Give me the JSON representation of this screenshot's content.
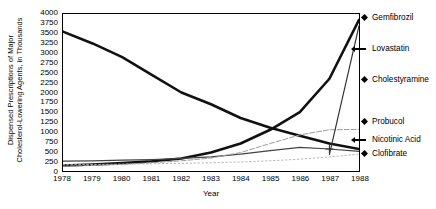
{
  "chart_data": {
    "type": "line",
    "title": "",
    "xlabel": "Year",
    "ylabel": "Dispensed Prescriptions of Major Cholesterol-Lowering Agents, in Thousands",
    "ylabel_line1": "Dispensed Prescriptions of Major",
    "ylabel_line2": "Cholesterol-Lowering Agents, in Thousands",
    "x": [
      1978,
      1979,
      1980,
      1981,
      1982,
      1983,
      1984,
      1985,
      1986,
      1987,
      1988
    ],
    "xtick_labels": [
      "1978",
      "1979",
      "1980",
      "1981",
      "1982",
      "1983",
      "1984",
      "1985",
      "1986",
      "1987",
      "1988"
    ],
    "xlim": [
      1978,
      1988
    ],
    "ylim": [
      0,
      4000
    ],
    "ytick_labels": [
      "4000",
      "3750",
      "3500",
      "3250",
      "3000",
      "2750",
      "2500",
      "2250",
      "2000",
      "1750",
      "1500",
      "1250",
      "1000",
      "750",
      "500",
      "250",
      "0"
    ],
    "ytick_values": [
      4000,
      3750,
      3500,
      3250,
      3000,
      2750,
      2500,
      2250,
      2000,
      1750,
      1500,
      1250,
      1000,
      750,
      500,
      250,
      0
    ],
    "grid": false,
    "legend_position": "right-outside",
    "series": [
      {
        "name": "Clofibrate",
        "marker": "diamond",
        "style": "solid-thick",
        "color": "#111111",
        "values": [
          3550,
          3250,
          2900,
          2450,
          2000,
          1700,
          1350,
          1100,
          900,
          700,
          560
        ]
      },
      {
        "name": "Gemfibrozil",
        "marker": "diamond",
        "style": "solid-thick",
        "color": "#111111",
        "values": [
          140,
          165,
          200,
          250,
          320,
          470,
          700,
          1050,
          1500,
          2350,
          3850
        ]
      },
      {
        "name": "Cholestyramine",
        "marker": "diamond",
        "style": "solid-thin",
        "color": "#444444",
        "values": [
          250,
          260,
          275,
          290,
          320,
          360,
          430,
          520,
          600,
          560,
          500
        ]
      },
      {
        "name": "Probucol",
        "marker": "diamond",
        "style": "dashed-light",
        "color": "#9a9a9a",
        "values": [
          120,
          140,
          170,
          210,
          260,
          330,
          470,
          700,
          920,
          1050,
          1060
        ]
      },
      {
        "name": "Nicotinic Acid",
        "marker": "arrow",
        "style": "dotted",
        "color": "#b5b5b5",
        "values": [
          160,
          165,
          175,
          185,
          195,
          210,
          230,
          260,
          300,
          360,
          430
        ]
      },
      {
        "name": "Lovastatin",
        "marker": "arrow",
        "style": "solid-thin",
        "color": "#333333",
        "values": [
          null,
          null,
          null,
          null,
          null,
          null,
          null,
          null,
          null,
          420,
          3700
        ]
      }
    ],
    "legend_entries": [
      {
        "label": "Gemfibrozil",
        "marker": "diamond",
        "y": 18
      },
      {
        "label": "Lovastatin",
        "marker": "arrow",
        "y": 49
      },
      {
        "label": "Cholestyramine",
        "marker": "diamond",
        "y": 80
      },
      {
        "label": "Probucol",
        "marker": "diamond",
        "y": 122
      },
      {
        "label": "Nicotinic Acid",
        "marker": "arrow",
        "y": 140
      },
      {
        "label": "Clofibrate",
        "marker": "diamond",
        "y": 154
      }
    ]
  }
}
